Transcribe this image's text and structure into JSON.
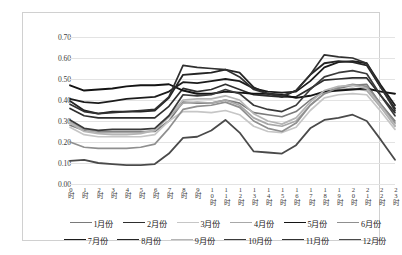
{
  "chart_data": {
    "type": "line",
    "title": "",
    "xlabel": "",
    "ylabel": "",
    "ylim": [
      0.0,
      0.7
    ],
    "ytick_step": 0.1,
    "grid": true,
    "legend_position": "bottom",
    "categories": [
      "0时",
      "1时",
      "2时",
      "3时",
      "4时",
      "5时",
      "6时",
      "7时",
      "8时",
      "9时",
      "10时",
      "11时",
      "12时",
      "13时",
      "14时",
      "15时",
      "16时",
      "17时",
      "18时",
      "19时",
      "20时",
      "21时",
      "22时",
      "23时"
    ],
    "ytick_labels": [
      "0.00",
      "0.10",
      "0.20",
      "0.30",
      "0.40",
      "0.50",
      "0.60",
      "0.70"
    ],
    "ytick_values": [
      0.0,
      0.1,
      0.2,
      0.3,
      0.4,
      0.5,
      0.6,
      0.7
    ],
    "series": [
      {
        "name": "1月份",
        "color": "#7a7a7a",
        "width": 1.6,
        "values": [
          0.28,
          0.255,
          0.25,
          0.25,
          0.25,
          0.25,
          0.25,
          0.3,
          0.39,
          0.385,
          0.385,
          0.4,
          0.385,
          0.34,
          0.33,
          0.32,
          0.345,
          0.4,
          0.44,
          0.455,
          0.47,
          0.475,
          0.38,
          0.3
        ]
      },
      {
        "name": "2月份",
        "color": "#2e2e2e",
        "width": 1.7,
        "values": [
          0.36,
          0.325,
          0.315,
          0.315,
          0.315,
          0.315,
          0.315,
          0.37,
          0.455,
          0.44,
          0.45,
          0.475,
          0.45,
          0.425,
          0.42,
          0.415,
          0.415,
          0.455,
          0.495,
          0.5,
          0.505,
          0.505,
          0.42,
          0.34
        ]
      },
      {
        "name": "3月份",
        "color": "#c6c6c6",
        "width": 1.7,
        "values": [
          0.27,
          0.235,
          0.225,
          0.225,
          0.225,
          0.225,
          0.235,
          0.3,
          0.345,
          0.345,
          0.34,
          0.35,
          0.33,
          0.275,
          0.25,
          0.245,
          0.27,
          0.35,
          0.41,
          0.425,
          0.43,
          0.425,
          0.345,
          0.26
        ]
      },
      {
        "name": "4月份",
        "color": "#a8a8a8",
        "width": 1.7,
        "values": [
          0.295,
          0.26,
          0.245,
          0.245,
          0.245,
          0.245,
          0.255,
          0.32,
          0.385,
          0.39,
          0.385,
          0.4,
          0.375,
          0.315,
          0.285,
          0.275,
          0.3,
          0.375,
          0.43,
          0.45,
          0.455,
          0.445,
          0.365,
          0.275
        ]
      },
      {
        "name": "5月份",
        "color": "#141414",
        "width": 1.9,
        "values": [
          0.47,
          0.445,
          0.45,
          0.455,
          0.465,
          0.47,
          0.47,
          0.475,
          0.445,
          0.43,
          0.43,
          0.44,
          0.435,
          0.43,
          0.43,
          0.425,
          0.41,
          0.42,
          0.44,
          0.445,
          0.45,
          0.455,
          0.44,
          0.43
        ]
      },
      {
        "name": "6月份",
        "color": "#8f8f8f",
        "width": 1.7,
        "values": [
          0.2,
          0.175,
          0.17,
          0.17,
          0.17,
          0.175,
          0.19,
          0.265,
          0.355,
          0.37,
          0.375,
          0.39,
          0.365,
          0.3,
          0.265,
          0.25,
          0.29,
          0.375,
          0.43,
          0.46,
          0.475,
          0.465,
          0.38,
          0.29
        ]
      },
      {
        "name": "7月份",
        "color": "#1c1c1c",
        "width": 1.8,
        "values": [
          0.405,
          0.39,
          0.385,
          0.395,
          0.405,
          0.41,
          0.415,
          0.44,
          0.485,
          0.48,
          0.49,
          0.5,
          0.49,
          0.455,
          0.44,
          0.435,
          0.44,
          0.49,
          0.555,
          0.58,
          0.585,
          0.575,
          0.47,
          0.375
        ]
      },
      {
        "name": "8月份",
        "color": "#252525",
        "width": 1.8,
        "values": [
          0.395,
          0.35,
          0.335,
          0.345,
          0.345,
          0.345,
          0.35,
          0.41,
          0.52,
          0.525,
          0.53,
          0.545,
          0.53,
          0.46,
          0.43,
          0.415,
          0.445,
          0.52,
          0.575,
          0.585,
          0.58,
          0.565,
          0.46,
          0.36
        ]
      },
      {
        "name": "9月份",
        "color": "#b5b5b5",
        "width": 1.7,
        "values": [
          0.29,
          0.25,
          0.24,
          0.235,
          0.235,
          0.24,
          0.255,
          0.325,
          0.4,
          0.405,
          0.405,
          0.42,
          0.4,
          0.335,
          0.3,
          0.285,
          0.315,
          0.39,
          0.445,
          0.465,
          0.47,
          0.455,
          0.37,
          0.28
        ]
      },
      {
        "name": "10月份",
        "color": "#3a3a3a",
        "width": 1.7,
        "values": [
          0.305,
          0.265,
          0.255,
          0.26,
          0.26,
          0.26,
          0.265,
          0.325,
          0.425,
          0.42,
          0.425,
          0.45,
          0.43,
          0.375,
          0.355,
          0.345,
          0.375,
          0.45,
          0.51,
          0.53,
          0.54,
          0.525,
          0.42,
          0.325
        ]
      },
      {
        "name": "11月份",
        "color": "#303030",
        "width": 1.7,
        "values": [
          0.38,
          0.345,
          0.335,
          0.34,
          0.345,
          0.35,
          0.355,
          0.415,
          0.565,
          0.555,
          0.55,
          0.545,
          0.51,
          0.45,
          0.43,
          0.42,
          0.445,
          0.52,
          0.615,
          0.605,
          0.6,
          0.575,
          0.46,
          0.35
        ]
      },
      {
        "name": "12月份",
        "color": "#4a4a4a",
        "width": 1.8,
        "values": [
          0.11,
          0.115,
          0.1,
          0.095,
          0.09,
          0.09,
          0.095,
          0.145,
          0.22,
          0.225,
          0.255,
          0.305,
          0.245,
          0.155,
          0.15,
          0.145,
          0.185,
          0.265,
          0.305,
          0.315,
          0.33,
          0.3,
          0.21,
          0.115
        ]
      }
    ]
  }
}
